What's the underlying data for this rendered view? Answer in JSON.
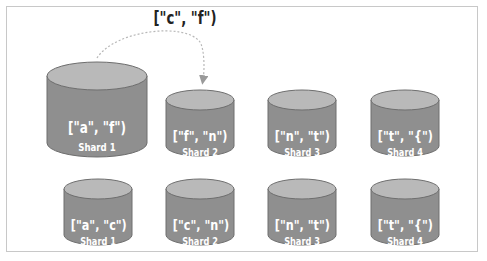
{
  "diagram": {
    "moved_range_label": "[\"c\", \"f\")",
    "colors": {
      "cylinder_top": "#b9b9b9",
      "cylinder_body": "#8f8f8f",
      "cylinder_outline": "#6e6e6e",
      "arrow": "#b0b0b0",
      "frame": "#c8c8c8",
      "text": "#ffffff"
    },
    "before": [
      {
        "name": "Shard 1",
        "range": "[\"a\", \"f\")"
      },
      {
        "name": "Shard 2",
        "range": "[\"f\", \"n\")"
      },
      {
        "name": "Shard 3",
        "range": "[\"n\", \"t\")"
      },
      {
        "name": "Shard 4",
        "range": "[\"t\", \"{\")"
      }
    ],
    "after": [
      {
        "name": "Shard 1",
        "range": "[\"a\", \"c\")"
      },
      {
        "name": "Shard 2",
        "range": "[\"c\", \"n\")"
      },
      {
        "name": "Shard 3",
        "range": "[\"n\", \"t\")"
      },
      {
        "name": "Shard 4",
        "range": "[\"t\", \"{\")"
      }
    ]
  }
}
